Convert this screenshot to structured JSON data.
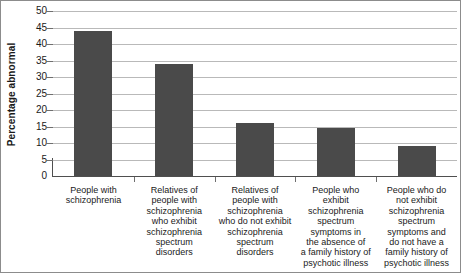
{
  "chart_data": {
    "type": "bar",
    "title": "",
    "xlabel": "",
    "ylabel": "Percentage abnormal",
    "ylim": [
      0,
      50
    ],
    "yticks": [
      0,
      5,
      10,
      15,
      20,
      25,
      30,
      35,
      40,
      45,
      50
    ],
    "grid": true,
    "legend": "none",
    "bar_color": "#4a4a4a",
    "categories": [
      "People with schizophrenia",
      "Relatives of people with schizophrenia who exhibit schizophrenia spectrum disorders",
      "Relatives of people with schizophrenia who do not exhibit schizophrenia spectrum disorders",
      "People who exhibit schizophrenia spectrum symptoms in the absence of a family history of psychotic illness",
      "People who do not exhibit schizophrenia spectrum symptoms and do not have a family history of psychotic illness"
    ],
    "category_lines": [
      [
        "People with",
        "schizophrenia"
      ],
      [
        "Relatives of",
        "people with",
        "schizophrenia",
        "who exhibit",
        "schizophrenia",
        "spectrum",
        "disorders"
      ],
      [
        "Relatives of",
        "people with",
        "schizophrenia",
        "who do not exhibit",
        "schizophrenia",
        "spectrum",
        "disorders"
      ],
      [
        "People who",
        "exhibit",
        "schizophrenia",
        "spectrum",
        "symptoms in",
        "the absence of",
        "a family history of",
        "psychotic illness"
      ],
      [
        "People who do",
        "not exhibit",
        "schizophrenia",
        "spectrum",
        "symptoms and",
        "do not have a",
        "family history of",
        "psychotic illness"
      ]
    ],
    "values": [
      44,
      34,
      16,
      14.5,
      9
    ]
  }
}
